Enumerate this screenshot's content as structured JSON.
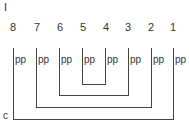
{
  "diagram": {
    "top_label": "I",
    "corner_label": "c",
    "line_color": "#444444",
    "nodes": [
      {
        "id": "8",
        "x": 13,
        "label": "pp"
      },
      {
        "id": "7",
        "x": 36,
        "label": "pp"
      },
      {
        "id": "6",
        "x": 59,
        "label": "pp"
      },
      {
        "id": "5",
        "x": 82,
        "label": "pp"
      },
      {
        "id": "4",
        "x": 105,
        "label": "pp"
      },
      {
        "id": "3",
        "x": 128,
        "label": "pp"
      },
      {
        "id": "2",
        "x": 151,
        "label": "pp"
      },
      {
        "id": "1",
        "x": 173,
        "label": "pp"
      }
    ],
    "brackets": [
      {
        "from": "5",
        "to": "4",
        "y": 84
      },
      {
        "from": "6",
        "to": "3",
        "y": 95
      },
      {
        "from": "7",
        "to": "2",
        "y": 107
      },
      {
        "from": "8",
        "to": "1",
        "y": 119
      }
    ],
    "line_top_y": 48
  }
}
